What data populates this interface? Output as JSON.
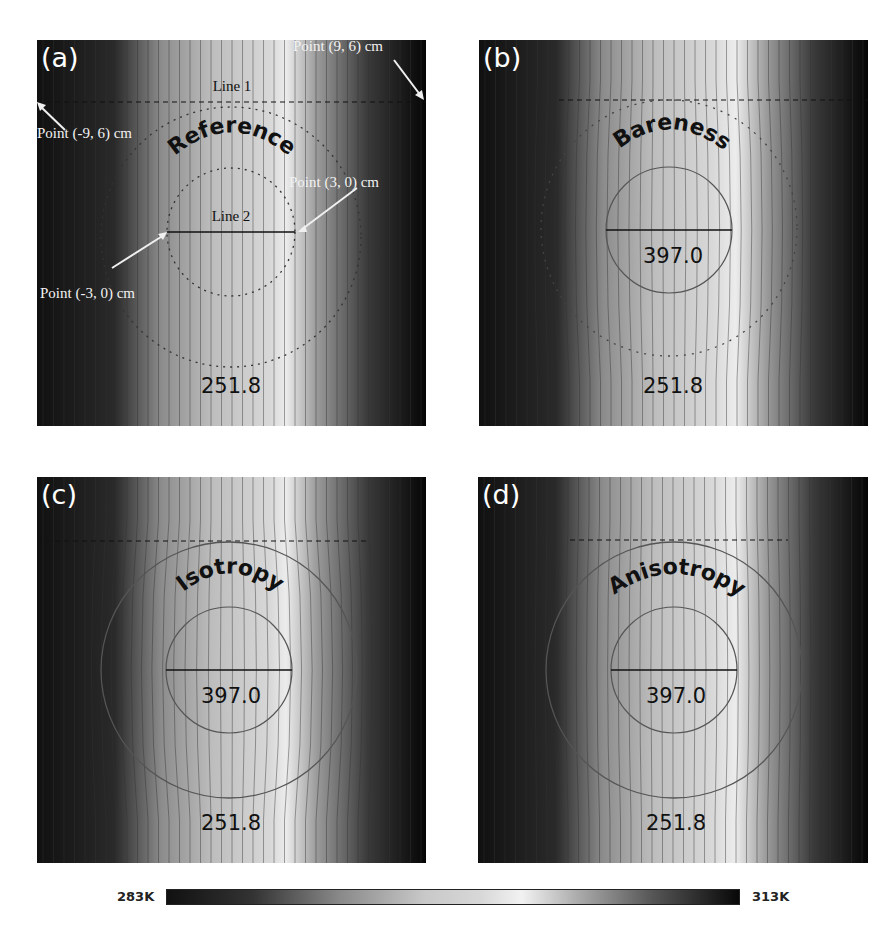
{
  "figure": {
    "panels": [
      {
        "id": "a",
        "label": "(a)",
        "title": "Reference",
        "center_value": null,
        "bottom_value": "251.8",
        "circle_style": "dashed"
      },
      {
        "id": "b",
        "label": "(b)",
        "title": "Bareness",
        "center_value": "397.0",
        "bottom_value": "251.8",
        "circle_style": "dotted-outer-solid-inner"
      },
      {
        "id": "c",
        "label": "(c)",
        "title": "Isotropy",
        "center_value": "397.0",
        "bottom_value": "251.8",
        "circle_style": "solid"
      },
      {
        "id": "d",
        "label": "(d)",
        "title": "Anisotropy",
        "center_value": "397.0",
        "bottom_value": "251.8",
        "circle_style": "solid"
      }
    ],
    "annotations_a": {
      "line1": "Line 1",
      "line2": "Line 2",
      "point_9_6": "Point (9, 6) cm",
      "point_m9_6": "Point (-9, 6) cm",
      "point_3_0": "Point (3, 0) cm",
      "point_m3_0": "Point (-3, 0) cm"
    },
    "colorbar": {
      "min_label": "283K",
      "max_label": "313K",
      "colormap": "grayscale (dark → light → dark)"
    }
  },
  "chart_data": {
    "type": "heatmap",
    "title": "",
    "panels": [
      "(a) Reference",
      "(b) Bareness",
      "(c) Isotropy",
      "(d) Anisotropy"
    ],
    "colorbar": {
      "min": 283,
      "max": 313,
      "unit": "K",
      "labels": [
        "283K",
        "313K"
      ]
    },
    "annotations": {
      "panel_a": [
        "Line 1",
        "Line 2",
        "Point (9, 6) cm",
        "Point (-9, 6) cm",
        "Point (3, 0) cm",
        "Point (-3, 0) cm"
      ],
      "values": {
        "a": [
          "251.8"
        ],
        "b": [
          "397.0",
          "251.8"
        ],
        "c": [
          "397.0",
          "251.8"
        ],
        "d": [
          "397.0",
          "251.8"
        ]
      }
    },
    "grid": false,
    "legend_position": "bottom colorbar"
  }
}
